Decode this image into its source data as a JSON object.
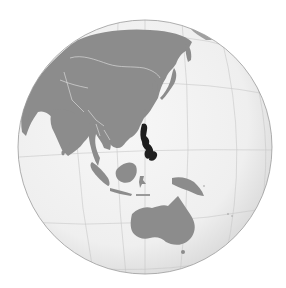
{
  "map": {
    "type": "orthographic-globe",
    "view": "Asia-Pacific hemisphere",
    "highlighted_country": "Philippines",
    "regions_visible": [
      "Asia",
      "Southeast Asia",
      "Indonesia",
      "New Guinea",
      "Australia",
      "Japan",
      "Korea",
      "Pacific Ocean",
      "Indian Ocean"
    ],
    "colors": {
      "background": "#ffffff",
      "ocean": "#f1f1f1",
      "ocean_edge": "#dcdcdc",
      "land": "#8c8c8c",
      "highlight": "#1e1e1e",
      "borders": "#e6e6e6",
      "graticule": "#c8c8c8",
      "outline": "#9a9a9a"
    },
    "globe": {
      "cx": 145,
      "cy": 147,
      "r": 127
    }
  }
}
